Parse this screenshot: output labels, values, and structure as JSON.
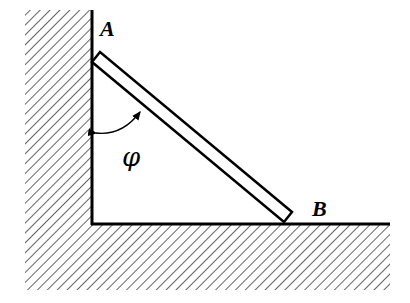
{
  "diagram": {
    "labels": {
      "top_end": "A",
      "bottom_end": "B",
      "angle": "φ"
    },
    "colors": {
      "stroke": "#000000",
      "hatch": "#555555",
      "background": "#ffffff"
    }
  }
}
